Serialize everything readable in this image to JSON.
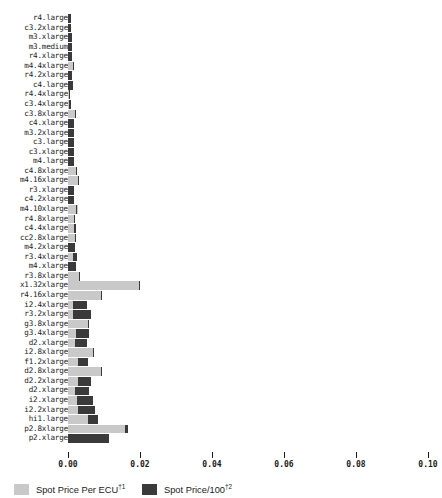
{
  "chart_data": {
    "type": "bar",
    "orientation": "horizontal",
    "title": "",
    "xlabel": "",
    "ylabel": "",
    "xlim": [
      0.0,
      0.1
    ],
    "xticks": [
      0.0,
      0.02,
      0.04,
      0.06,
      0.08,
      0.1
    ],
    "xtick_labels": [
      "0.00",
      "0.02",
      "0.04",
      "0.06",
      "0.08",
      "0.10"
    ],
    "grid": false,
    "legend_position": "below-axis-left",
    "categories": [
      "r4.large",
      "c3.2xlarge",
      "m3.xlarge",
      "m3.medium",
      "r4.xlarge",
      "m4.4xlarge",
      "r4.2xlarge",
      "c4.large",
      "r4.4xlarge",
      "c3.4xlarge",
      "c3.8xlarge",
      "c4.xlarge",
      "m3.2xlarge",
      "c3.large",
      "c3.xlarge",
      "m4.large",
      "c4.8xlarge",
      "m4.16xlarge",
      "r3.xlarge",
      "c4.2xlarge",
      "m4.10xlarge",
      "r4.8xlarge",
      "c4.4xlarge",
      "cc2.8xlarge",
      "m4.2xlarge",
      "r3.4xlarge",
      "m4.xlarge",
      "r3.8xlarge",
      "x1.32xlarge",
      "r4.16xlarge",
      "i2.4xlarge",
      "r3.2xlarge",
      "g3.8xlarge",
      "g3.4xlarge",
      "d2.xlarge",
      "i2.8xlarge",
      "f1.2xlarge",
      "d2.8xlarge",
      "d2.2xlarge",
      "d2.xlarge",
      "i2.xlarge",
      "i2.2xlarge",
      "hi1.large",
      "p2.8xlarge",
      "p2.xlarge"
    ],
    "series": [
      {
        "name": "Spot Price Per ECU",
        "color": "#c9c9c9",
        "values": [
          0.00083,
          0.00097,
          0.00111,
          0.00111,
          0.00111,
          0.00167,
          0.00111,
          0.00125,
          0.00069,
          0.00083,
          0.00236,
          0.00153,
          0.00153,
          0.00153,
          0.00153,
          0.00153,
          0.0025,
          0.00292,
          0.00167,
          0.00167,
          0.00264,
          0.00208,
          0.00222,
          0.00222,
          0.00194,
          0.0025,
          0.00222,
          0.00333,
          0.02,
          0.00944,
          0.00528,
          0.00625,
          0.00583,
          0.00583,
          0.00514,
          0.00736,
          0.00542,
          0.00958,
          0.00639,
          0.00597,
          0.00694,
          0.0075,
          0.00833,
          0.01653,
          0.00722
        ]
      },
      {
        "name": "Spot Price/100",
        "color": "#3a3a3a",
        "values": [
          0.00083,
          0.00097,
          0.00111,
          0.00111,
          0.00111,
          0.00042,
          0.00111,
          0.00125,
          0.00042,
          0.00042,
          0.00014,
          0.00153,
          0.00153,
          0.00153,
          0.00153,
          0.00153,
          0.00028,
          0.00028,
          0.00167,
          0.00167,
          0.00028,
          0.00028,
          0.00055,
          0.00014,
          0.00194,
          0.00125,
          0.00222,
          0.00028,
          0.00028,
          0.00028,
          0.00403,
          0.005,
          0.00028,
          0.00361,
          0.00333,
          0.00028,
          0.00264,
          0.00028,
          0.00361,
          0.00403,
          0.00444,
          0.00486,
          0.00278,
          0.00083,
          0.01139
        ]
      }
    ],
    "legend": [
      {
        "label": "Spot Price Per ECU",
        "sup": "†1",
        "color": "#c9c9c9"
      },
      {
        "label": "Spot Price/100",
        "sup": "†2",
        "color": "#3a3a3a"
      }
    ]
  }
}
